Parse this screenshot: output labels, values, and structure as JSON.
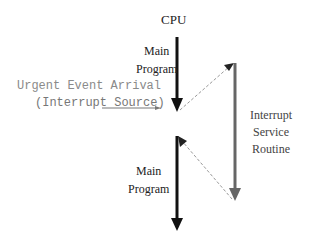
{
  "diagram": {
    "title": "CPU",
    "main_program_top": [
      "Main",
      "Program"
    ],
    "main_program_bottom": [
      "Main",
      "Program"
    ],
    "event_label": "Urgent Event Arrival",
    "event_sublabel": "(Interrupt Source)",
    "isr_label": [
      "Interrupt",
      "Service",
      "Routine"
    ],
    "colors": {
      "main_arrow": "#111111",
      "isr_arrow": "#666666",
      "dashed": "#999999",
      "event_text": "#8a8a8a"
    }
  }
}
